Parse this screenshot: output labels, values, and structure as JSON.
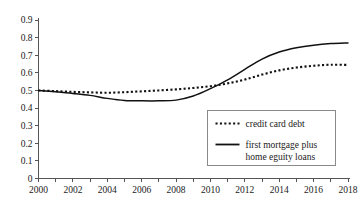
{
  "chart_data": {
    "type": "line",
    "title": "",
    "subtitle": "",
    "xlabel": "",
    "ylabel": "",
    "xlim": [
      2000,
      2018
    ],
    "ylim": [
      0,
      0.9
    ],
    "grid": false,
    "legend_position": "bottom-right",
    "x": [
      2000,
      2001,
      2002,
      2003,
      2004,
      2005,
      2006,
      2007,
      2008,
      2009,
      2010,
      2011,
      2012,
      2013,
      2014,
      2015,
      2016,
      2017,
      2018
    ],
    "xticks_major": [
      2000,
      2002,
      2004,
      2006,
      2008,
      2010,
      2012,
      2014,
      2016,
      2018
    ],
    "xticks_minor": [
      2001,
      2003,
      2005,
      2007,
      2009,
      2011,
      2013,
      2015,
      2017
    ],
    "xtick_labels": [
      "2000",
      "2002",
      "2004",
      "2006",
      "2008",
      "2010",
      "2012",
      "2014",
      "2016",
      "2018"
    ],
    "yticks": [
      0,
      0.1,
      0.2,
      0.3,
      0.4,
      0.5,
      0.6,
      0.7,
      0.8,
      0.9
    ],
    "ytick_labels": [
      "0",
      "0.1",
      "0.2",
      "0.3",
      "0.4",
      "0.5",
      "0.6",
      "0.7",
      "0.8",
      "0.9"
    ],
    "series": [
      {
        "name": "credit card debt",
        "style": "dotted",
        "color": "#111111",
        "values": [
          0.5,
          0.496,
          0.492,
          0.489,
          0.487,
          0.49,
          0.495,
          0.5,
          0.506,
          0.514,
          0.524,
          0.54,
          0.562,
          0.59,
          0.614,
          0.63,
          0.64,
          0.646,
          0.645
        ]
      },
      {
        "name": "first mortgage plus home eguity loans",
        "style": "solid",
        "color": "#111111",
        "values": [
          0.5,
          0.492,
          0.483,
          0.472,
          0.455,
          0.443,
          0.441,
          0.441,
          0.445,
          0.468,
          0.51,
          0.56,
          0.62,
          0.678,
          0.718,
          0.742,
          0.757,
          0.766,
          0.77
        ]
      }
    ]
  },
  "legend": {
    "entries": [
      {
        "label": "credit card debt",
        "style": "dotted"
      },
      {
        "label_line1": "first mortgage plus",
        "label_line2": "home eguity loans",
        "style": "solid"
      }
    ]
  }
}
